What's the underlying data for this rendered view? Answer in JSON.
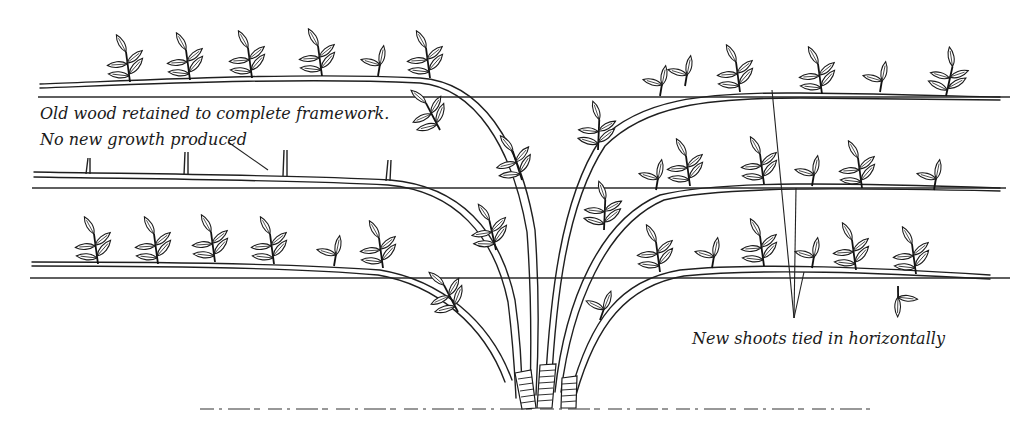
{
  "diagram": {
    "type": "botanical-line-drawing",
    "labels": {
      "old_wood_line1": "Old wood retained to complete framework.",
      "old_wood_line2": "No new growth produced",
      "new_shoots": "New shoots tied in horizontally"
    },
    "wires": [
      {
        "name": "top-wire",
        "y": 97
      },
      {
        "name": "middle-wire",
        "y": 188
      },
      {
        "name": "bottom-wire",
        "y": 278
      }
    ],
    "colors": {
      "ink": "#1a1a1a",
      "background": "#ffffff"
    }
  }
}
